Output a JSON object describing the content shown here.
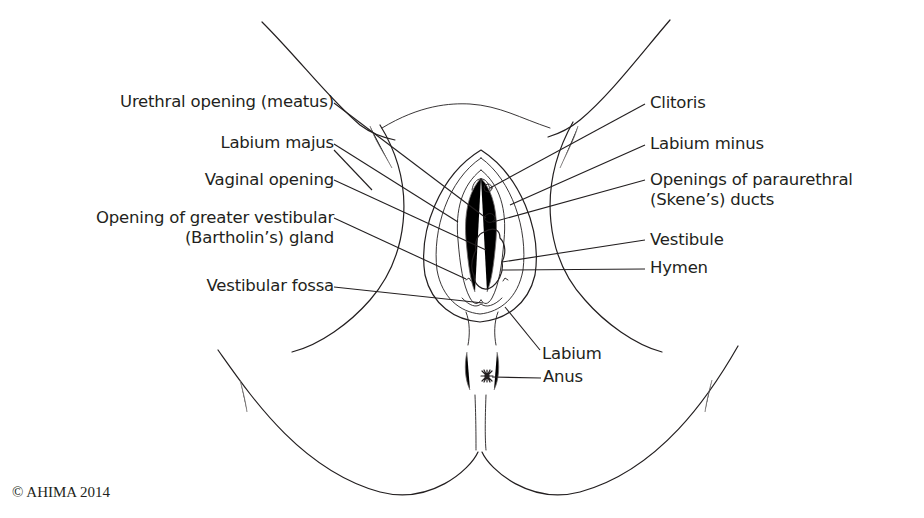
{
  "figure": {
    "labels_left": [
      {
        "id": "urethral-opening",
        "text": "Urethral opening (meatus)"
      },
      {
        "id": "labium-majus",
        "text": "Labium majus"
      },
      {
        "id": "vaginal-opening",
        "text": "Vaginal opening"
      },
      {
        "id": "greater-vestibular-gland",
        "line1": "Opening of greater vestibular",
        "line2": "(Bartholin’s) gland"
      },
      {
        "id": "vestibular-fossa",
        "text": "Vestibular fossa"
      }
    ],
    "labels_right": [
      {
        "id": "clitoris",
        "text": "Clitoris"
      },
      {
        "id": "labium-minus",
        "text": "Labium minus"
      },
      {
        "id": "paraurethral-ducts",
        "line1": "Openings of paraurethral",
        "line2": "(Skene’s) ducts"
      },
      {
        "id": "vestibule",
        "text": "Vestibule"
      },
      {
        "id": "hymen",
        "text": "Hymen"
      }
    ],
    "labels_bottom": [
      {
        "id": "labium",
        "text": "Labium"
      },
      {
        "id": "anus",
        "text": "Anus"
      }
    ]
  },
  "copyright": "© AHIMA 2014"
}
